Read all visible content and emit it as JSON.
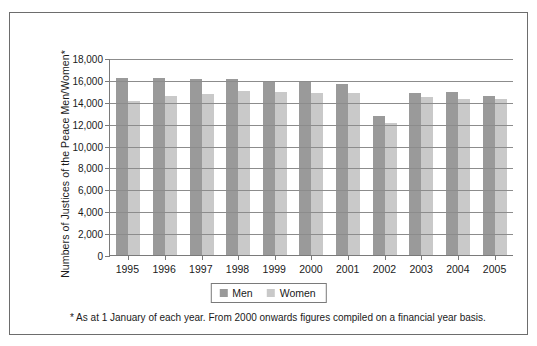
{
  "chart_data": {
    "type": "bar",
    "title": "",
    "xlabel": "",
    "ylabel": "Numbers of Justices of the Peace Men/Women*",
    "ylim": [
      0,
      18000
    ],
    "ytick_step": 2000,
    "grid": true,
    "legend_position": "bottom-center",
    "categories": [
      "1995",
      "1996",
      "1997",
      "1998",
      "1999",
      "2000",
      "2001",
      "2002",
      "2003",
      "2004",
      "2005"
    ],
    "series": [
      {
        "name": "Men",
        "color": "#9a9a9a",
        "values": [
          16200,
          16150,
          16100,
          16050,
          15900,
          15800,
          15600,
          12700,
          14800,
          14850,
          14500
        ]
      },
      {
        "name": "Women",
        "color": "#c9c9c9",
        "values": [
          14100,
          14500,
          14700,
          15000,
          14900,
          14800,
          14800,
          12100,
          14400,
          14300,
          14250
        ]
      }
    ],
    "ytick_labels": [
      "18,000",
      "16,000",
      "14,000",
      "12,000",
      "10,000",
      "8,000",
      "6,000",
      "4,000",
      "2,000",
      "0"
    ],
    "annotations": [
      "* As at 1 January of each year. From 2000 onwards figures compiled on a financial year basis."
    ]
  },
  "legend": {
    "items": [
      {
        "label": "Men"
      },
      {
        "label": "Women"
      }
    ]
  },
  "footnote": {
    "text": "* As at 1 January of each year. From 2000 onwards figures compiled on a financial year basis."
  }
}
